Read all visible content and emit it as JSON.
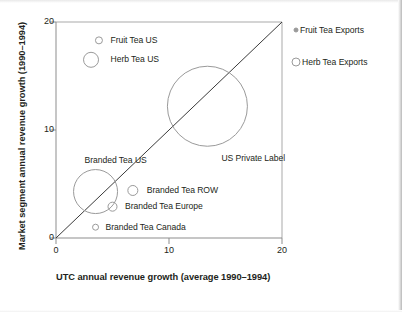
{
  "chart_data": {
    "type": "scatter",
    "title": "",
    "xlabel": "UTC annual revenue growth (average 1990–1994)",
    "ylabel": "Market segment annual revenue growth (1990–1994)",
    "xlim": [
      0,
      20
    ],
    "ylim": [
      0,
      20
    ],
    "xticks": [
      "0",
      "10",
      "20"
    ],
    "xtick_values": [
      0,
      10,
      20
    ],
    "yticks": [
      "0",
      "10",
      "20"
    ],
    "ytick_values": [
      0,
      10,
      20
    ],
    "grid": false,
    "legend_position": "right",
    "reference_line": {
      "name": "diagonal-parity-line",
      "from": [
        0,
        0
      ],
      "to": [
        20,
        20
      ],
      "color": "#3a3a3a"
    },
    "marker_style": "open-circle",
    "marker_color": "#9a9a9a",
    "points": [
      {
        "label": "Fruit Tea US",
        "x": 3.8,
        "y": 18.3,
        "r_px": 3.5,
        "label_dx": 8,
        "label_dy": 0
      },
      {
        "label": "Herb Tea US",
        "x": 3.1,
        "y": 16.5,
        "r_px": 7.5,
        "label_dx": 12,
        "label_dy": 0
      },
      {
        "label": "US Private Label",
        "x": 13.4,
        "y": 12.2,
        "r_px": 40.0,
        "label_dx": -26,
        "label_dy": 52
      },
      {
        "label": "Branded Tea US",
        "x": 3.5,
        "y": 4.3,
        "r_px": 22.0,
        "label_dx": -33,
        "label_dy": -31
      },
      {
        "label": "Branded Tea ROW",
        "x": 6.8,
        "y": 4.4,
        "r_px": 5.0,
        "label_dx": 9,
        "label_dy": 0
      },
      {
        "label": "Branded Tea Europe",
        "x": 5.0,
        "y": 2.9,
        "r_px": 4.5,
        "label_dx": 8,
        "label_dy": 0
      },
      {
        "label": "Branded Tea Canada",
        "x": 3.5,
        "y": 1.0,
        "r_px": 3.0,
        "label_dx": 7,
        "label_dy": 0
      }
    ],
    "legend": [
      {
        "label": "Fruit Tea Exports",
        "r_px": 2.0,
        "note": "small bubble size key"
      },
      {
        "label": "Herb Tea Exports",
        "r_px": 4.0,
        "note": "larger bubble size key"
      }
    ],
    "colors": {
      "marker_stroke": "#9a9a9a",
      "axis": "#8d8d8d",
      "line": "#3a3a3a",
      "text": "#231f20",
      "background": "#ffffff"
    }
  }
}
